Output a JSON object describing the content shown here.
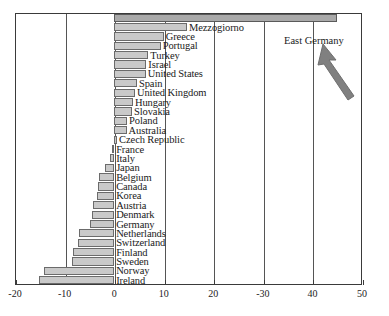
{
  "chart_data": {
    "type": "bar",
    "orientation": "horizontal",
    "title": "",
    "subtitle": "",
    "xlabel": "",
    "ylabel": "",
    "xlim": [
      -20,
      50
    ],
    "ylim": null,
    "grid": true,
    "gridlines_axis": "x",
    "legend": null,
    "legend_position": "none",
    "xticks": [
      -20,
      -10,
      0,
      10,
      20,
      30,
      40,
      50
    ],
    "xtick_labels": [
      "-20",
      "-10",
      "0",
      "10",
      "20",
      "-30",
      "40",
      "50"
    ],
    "categories": [
      "East Germany",
      "Mezzogiorno",
      "Greece",
      "Portugal",
      "Turkey",
      "Israel",
      "United States",
      "Spain",
      "United Kingdom",
      "Hungary",
      "Slovakia",
      "Poland",
      "Australia",
      "Czech Republic",
      "France",
      "Italy",
      "Japan",
      "Belgium",
      "Canada",
      "Korea",
      "Austria",
      "Denmark",
      "Germany",
      "Netherlands",
      "Switzerland",
      "Finland",
      "Sweden",
      "Norway",
      "Ireland"
    ],
    "values": [
      45.0,
      14.7,
      10.0,
      9.4,
      6.9,
      6.5,
      6.4,
      4.6,
      4.2,
      3.8,
      3.6,
      2.6,
      2.5,
      0.6,
      -0.4,
      -0.8,
      -1.8,
      -3.0,
      -3.2,
      -3.4,
      -4.2,
      -4.4,
      -4.8,
      -7.0,
      -7.2,
      -8.4,
      -8.6,
      -14.2,
      -15.2
    ],
    "annotations": [
      {
        "text": "East Germany",
        "type": "arrow-label",
        "points_to": "East Germany"
      }
    ]
  },
  "labels": {
    "east_germany": "East Germany"
  }
}
